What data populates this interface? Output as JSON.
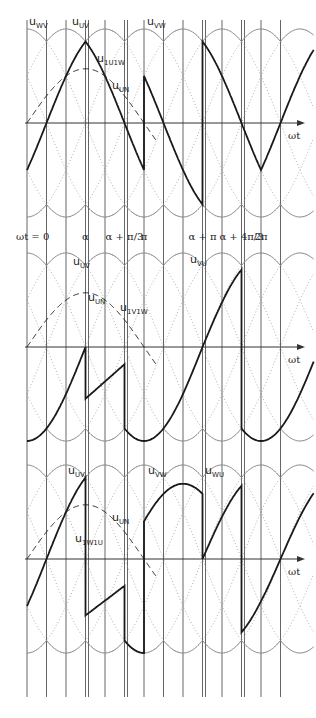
{
  "figure": {
    "type": "power-electronics-waveforms",
    "grid": {
      "vertical_lines": 14,
      "step": "π/6"
    },
    "axis_label": "ωt",
    "x_ticks": [
      {
        "label": "ωt = 0",
        "pos": 0
      },
      {
        "label": "α",
        "pos": 0.5
      },
      {
        "label": "α + π/3",
        "pos": 0.8333
      },
      {
        "label": "π",
        "pos": 1.0
      },
      {
        "label": "α + π",
        "pos": 1.5
      },
      {
        "label": "α + 4π/3",
        "pos": 1.8333
      },
      {
        "label": "2π",
        "pos": 2.0
      }
    ],
    "panels": [
      {
        "id": "top",
        "labels": [
          {
            "main": "u",
            "sub": "WV",
            "x": 29,
            "y": 16
          },
          {
            "main": "u",
            "sub": "UV",
            "x": 72,
            "y": 16
          },
          {
            "main": "u",
            "sub": "1U1W",
            "x": 97,
            "y": 53
          },
          {
            "main": "u",
            "sub": "UN",
            "x": 112,
            "y": 80
          },
          {
            "main": "u",
            "sub": "VW",
            "x": 147,
            "y": 16
          }
        ],
        "output_curve": "u_1U1W",
        "axis_label": "ωt"
      },
      {
        "id": "middle",
        "labels": [
          {
            "main": "u",
            "sub": "UV",
            "x": 73,
            "y": 256
          },
          {
            "main": "u",
            "sub": "UN",
            "x": 88,
            "y": 292
          },
          {
            "main": "u",
            "sub": "1V1W",
            "x": 120,
            "y": 302
          },
          {
            "main": "u",
            "sub": "VU",
            "x": 190,
            "y": 254
          }
        ],
        "output_curve": "u_1V1W",
        "axis_label": "ωt"
      },
      {
        "id": "bottom",
        "labels": [
          {
            "main": "u",
            "sub": "UV",
            "x": 68,
            "y": 465
          },
          {
            "main": "u",
            "sub": "VW",
            "x": 148,
            "y": 465
          },
          {
            "main": "u",
            "sub": "WU",
            "x": 205,
            "y": 465
          },
          {
            "main": "u",
            "sub": "UN",
            "x": 112,
            "y": 512
          },
          {
            "main": "u",
            "sub": "1W1U",
            "x": 75,
            "y": 533
          }
        ],
        "output_curve": "u_1W1U",
        "axis_label": "ωt"
      }
    ],
    "colors": {
      "output": "#1a1a1a",
      "envelope": "#8c8c8c",
      "dotted": "#9a9a9a",
      "grid": "#555555",
      "axis": "#333333"
    }
  }
}
